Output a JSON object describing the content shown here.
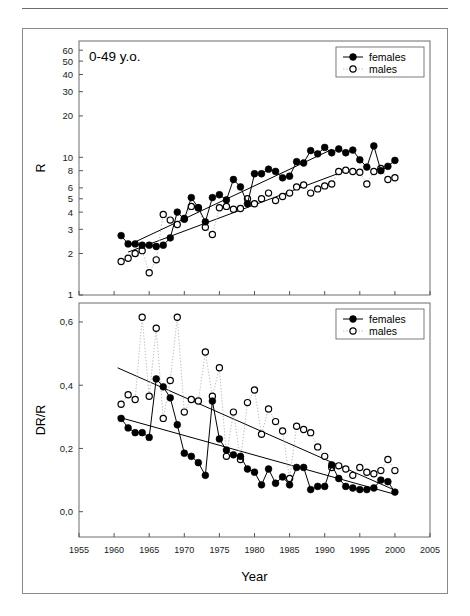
{
  "figure": {
    "panel_label": "0-49 y.o.",
    "xaxis_title": "Year"
  },
  "legend": {
    "females_label": "females",
    "males_label": "males"
  },
  "colors": {
    "females": "#000000",
    "males": "#000000",
    "males_line": "#b8b8b8",
    "trend": "#000000",
    "frame": "#6d6d6d",
    "axis": "#555555"
  },
  "chart_data": [
    {
      "type": "scatter",
      "id": "panel-top",
      "title": "0-49 y.o.",
      "xlabel": "",
      "ylabel": "R",
      "yscale": "log",
      "xlim": [
        1955,
        2005
      ],
      "ylim": [
        1,
        70
      ],
      "grid": false,
      "legend_position": "top-right",
      "xticks": [
        1955,
        1960,
        1965,
        1970,
        1975,
        1980,
        1985,
        1990,
        1995,
        2000,
        2005
      ],
      "xticklabels": [
        "1955",
        "1960",
        "1965",
        "1970",
        "1975",
        "1980",
        "1985",
        "1990",
        "1995",
        "2000",
        "2005"
      ],
      "yticks": [
        1,
        2,
        3,
        4,
        5,
        6,
        8,
        10,
        20,
        30,
        40,
        50,
        60
      ],
      "yticklabels": [
        "1",
        "2",
        "3",
        "4",
        "5",
        "6",
        "8",
        "10",
        "20",
        "30",
        "40",
        "50",
        "60"
      ],
      "series": [
        {
          "name": "females",
          "marker": "filled-circle",
          "line": "solid",
          "x": [
            1961,
            1962,
            1963,
            1964,
            1965,
            1966,
            1967,
            1968,
            1969,
            1970,
            1971,
            1972,
            1973,
            1974,
            1975,
            1976,
            1977,
            1978,
            1979,
            1980,
            1981,
            1982,
            1983,
            1984,
            1985,
            1986,
            1987,
            1988,
            1989,
            1990,
            1991,
            1992,
            1993,
            1994,
            1995,
            1996,
            1997,
            1998,
            1999,
            2000
          ],
          "values": [
            2.7,
            2.35,
            2.35,
            2.3,
            2.3,
            2.25,
            2.3,
            2.6,
            4.0,
            3.55,
            5.1,
            4.3,
            3.4,
            5.1,
            5.35,
            4.9,
            6.9,
            6.1,
            4.6,
            7.6,
            7.6,
            8.2,
            7.9,
            7.1,
            7.3,
            9.3,
            9.1,
            11.2,
            10.6,
            11.8,
            10.8,
            11.5,
            10.8,
            11.3,
            9.6,
            8.5,
            12.1,
            8.0,
            8.6,
            9.5
          ]
        },
        {
          "name": "males",
          "marker": "open-circle",
          "line": "dotted",
          "x": [
            1961,
            1962,
            1963,
            1964,
            1965,
            1966,
            1967,
            1968,
            1969,
            1970,
            1971,
            1972,
            1973,
            1974,
            1975,
            1976,
            1977,
            1978,
            1979,
            1980,
            1981,
            1982,
            1983,
            1984,
            1985,
            1986,
            1987,
            1988,
            1989,
            1990,
            1991,
            1992,
            1993,
            1994,
            1995,
            1996,
            1997,
            1998,
            1999,
            2000
          ],
          "values": [
            1.75,
            1.85,
            2.0,
            2.1,
            1.45,
            1.8,
            3.85,
            3.5,
            3.25,
            3.6,
            4.4,
            4.3,
            3.1,
            2.75,
            4.3,
            4.4,
            4.2,
            4.25,
            5.0,
            4.6,
            5.0,
            5.5,
            4.85,
            5.2,
            5.5,
            6.1,
            6.3,
            5.5,
            5.9,
            6.2,
            6.4,
            7.9,
            8.05,
            7.9,
            7.8,
            6.4,
            7.9,
            8.3,
            6.9,
            7.1
          ]
        }
      ],
      "trend_lines": [
        {
          "name": "females-trend",
          "x": [
            1962,
            1991
          ],
          "y": [
            2.3,
            11.4
          ]
        },
        {
          "name": "males-trend",
          "x": [
            1962,
            1993
          ],
          "y": [
            2.05,
            8.0
          ]
        }
      ]
    },
    {
      "type": "scatter",
      "id": "panel-bottom",
      "title": "",
      "xlabel": "Year",
      "ylabel": "DR/R",
      "yscale": "linear",
      "xlim": [
        1955,
        2005
      ],
      "ylim": [
        -0.08,
        0.66
      ],
      "grid": false,
      "legend_position": "top-right",
      "xticks": [
        1955,
        1960,
        1965,
        1970,
        1975,
        1980,
        1985,
        1990,
        1995,
        2000,
        2005
      ],
      "xticklabels": [
        "1955",
        "1960",
        "1965",
        "1970",
        "1975",
        "1980",
        "1985",
        "1990",
        "1995",
        "2000",
        "2005"
      ],
      "yticks": [
        0.0,
        0.2,
        0.4,
        0.6
      ],
      "yticklabels": [
        "0,0",
        "0,2",
        "0,4",
        "0,6"
      ],
      "series": [
        {
          "name": "females",
          "marker": "filled-circle",
          "line": "solid",
          "x": [
            1961,
            1962,
            1963,
            1964,
            1965,
            1966,
            1967,
            1968,
            1969,
            1970,
            1971,
            1972,
            1973,
            1974,
            1975,
            1976,
            1977,
            1978,
            1979,
            1980,
            1981,
            1982,
            1983,
            1984,
            1985,
            1986,
            1987,
            1988,
            1989,
            1990,
            1991,
            1992,
            1993,
            1994,
            1995,
            1996,
            1997,
            1998,
            1999,
            2000
          ],
          "values": [
            0.295,
            0.265,
            0.25,
            0.25,
            0.235,
            0.42,
            0.395,
            0.36,
            0.275,
            0.185,
            0.175,
            0.155,
            0.115,
            0.35,
            0.23,
            0.195,
            0.18,
            0.175,
            0.135,
            0.125,
            0.085,
            0.135,
            0.09,
            0.11,
            0.085,
            0.14,
            0.14,
            0.07,
            0.08,
            0.08,
            0.148,
            0.105,
            0.08,
            0.075,
            0.07,
            0.07,
            0.075,
            0.1,
            0.095,
            0.062,
            0.06,
            0.068,
            0.033,
            0.1,
            0.095,
            0.058
          ]
        },
        {
          "name": "males",
          "marker": "open-circle",
          "line": "dotted",
          "x": [
            1961,
            1962,
            1963,
            1964,
            1965,
            1966,
            1967,
            1968,
            1969,
            1970,
            1971,
            1972,
            1973,
            1974,
            1975,
            1976,
            1977,
            1978,
            1979,
            1980,
            1981,
            1982,
            1983,
            1984,
            1985,
            1986,
            1987,
            1988,
            1989,
            1990,
            1991,
            1992,
            1993,
            1994,
            1995,
            1996,
            1997,
            1998,
            1999,
            2000
          ],
          "values": [
            0.34,
            0.37,
            0.355,
            0.615,
            0.365,
            0.58,
            0.295,
            0.415,
            0.615,
            0.315,
            0.355,
            0.35,
            0.505,
            0.365,
            0.455,
            0.175,
            0.315,
            0.165,
            0.345,
            0.385,
            0.245,
            0.325,
            0.285,
            0.255,
            0.105,
            0.27,
            0.26,
            0.25,
            0.205,
            0.175,
            0.14,
            0.145,
            0.135,
            0.115,
            0.14,
            0.125,
            0.12,
            0.13,
            0.165,
            0.13
          ]
        }
      ],
      "trend_lines": [
        {
          "name": "males-trend",
          "x": [
            1960.5,
            2000
          ],
          "y": [
            0.455,
            0.068
          ]
        },
        {
          "name": "females-trend",
          "x": [
            1960.5,
            2000
          ],
          "y": [
            0.3,
            0.055
          ]
        }
      ]
    }
  ]
}
